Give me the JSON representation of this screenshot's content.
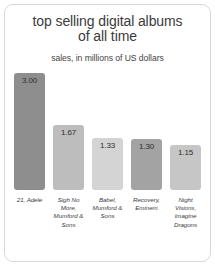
{
  "chart_data": {
    "type": "bar",
    "title": "top selling digital albums of all time",
    "title_line1": "top selling digital albums",
    "title_line2": "of all time",
    "subtitle": "sales, in millions of US dollars",
    "xlabel": "",
    "ylabel": "",
    "ylim": [
      0,
      3.0
    ],
    "grid": false,
    "legend": false,
    "categories": [
      "21, Adele",
      "Sigh No More, Mumford & Sons",
      "Babel, Mumford & Sons",
      "Recovery, Eminem",
      "Night Visions, Imagine Dragons"
    ],
    "values": [
      3.0,
      1.67,
      1.33,
      1.3,
      1.15
    ],
    "value_labels": [
      "3.00",
      "1.67",
      "1.33",
      "1.30",
      "1.15"
    ],
    "bar_colors": [
      "#8e8e8e",
      "#bdbdbd",
      "#d4d4d4",
      "#a3a3a3",
      "#c6c6c6"
    ],
    "bars": [
      {
        "label": "21, Adele",
        "value": 3.0,
        "value_label": "3.00",
        "color": "#8e8e8e"
      },
      {
        "label": "Sigh No More, Mumford & Sons",
        "value": 1.67,
        "value_label": "1.67",
        "color": "#bdbdbd"
      },
      {
        "label": "Babel, Mumford & Sons",
        "value": 1.33,
        "value_label": "1.33",
        "color": "#d4d4d4"
      },
      {
        "label": "Recovery, Eminem",
        "value": 1.3,
        "value_label": "1.30",
        "color": "#a3a3a3"
      },
      {
        "label": "Night Visions, Imagine Dragons",
        "value": 1.15,
        "value_label": "1.15",
        "color": "#c6c6c6"
      }
    ]
  },
  "style": {
    "background": "#ffffff",
    "frame_color": "#d8d8d8",
    "title_color": "#3b3b3b",
    "label_color": "#3a3a3a"
  }
}
